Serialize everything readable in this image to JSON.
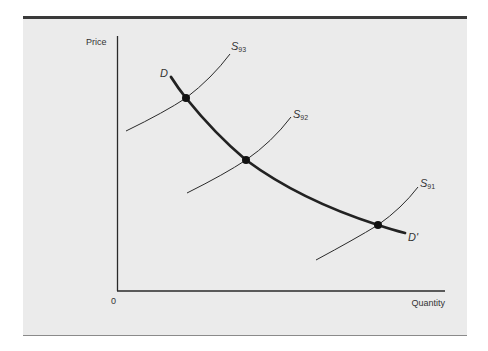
{
  "diagram": {
    "type": "supply-demand",
    "axes": {
      "y_label": "Price",
      "x_label": "Quantity",
      "origin_label": "0"
    },
    "demand": {
      "start_label": "D",
      "end_label": "D'"
    },
    "supply_curves": [
      {
        "symbol": "S",
        "subscript": "93"
      },
      {
        "symbol": "S",
        "subscript": "92"
      },
      {
        "symbol": "S",
        "subscript": "91"
      }
    ],
    "equilibrium_points": 3,
    "colors": {
      "background": "#ebebeb",
      "ink": "#2a2a2a",
      "rule": "#3a3a3a"
    }
  }
}
